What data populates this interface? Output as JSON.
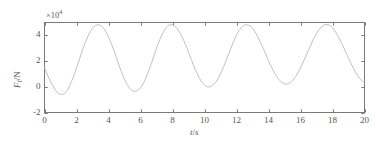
{
  "figure": {
    "exponent_label": "×10",
    "exponent_power": "4",
    "xaxis": {
      "title_var": "t",
      "title_sep": "/",
      "title_unit": "s",
      "ticks": [
        "0",
        "2",
        "4",
        "6",
        "8",
        "10",
        "12",
        "14",
        "16",
        "18",
        "20"
      ]
    },
    "yaxis": {
      "title_var": "F",
      "title_sub": "f",
      "title_sep": "/",
      "title_unit": "N",
      "ticks": [
        "-2",
        "0",
        "2",
        "4"
      ]
    },
    "line_color": "#b9b9b9",
    "axis_color": "#7a7a7a"
  },
  "chart_data": {
    "type": "line",
    "title": "",
    "xlabel": "t/s",
    "ylabel": "F_f/N",
    "xlim": [
      0,
      20
    ],
    "ylim": [
      -2,
      5
    ],
    "y_scale": 10000,
    "y_scale_label": "×10^4",
    "grid": false,
    "legend": null,
    "xticks": [
      0,
      2,
      4,
      6,
      8,
      10,
      12,
      14,
      16,
      18,
      20
    ],
    "yticks": [
      -2,
      0,
      2,
      4
    ],
    "series": [
      {
        "name": "F_f",
        "color": "#b9b9b9",
        "mean_value": 18000,
        "amplitude": 30000,
        "period": 4.0,
        "phase_peak_time": 2.9,
        "x": [
          0.0,
          0.2,
          0.4,
          0.6,
          0.8,
          1.0,
          1.2,
          1.4,
          1.6,
          1.8,
          2.0,
          2.2,
          2.4,
          2.6,
          2.8,
          3.0,
          3.2,
          3.4,
          3.6,
          3.8,
          4.0,
          4.2,
          4.4,
          4.6,
          4.8,
          5.0,
          5.2,
          5.4,
          5.6,
          5.8,
          6.0,
          6.2,
          6.4,
          6.6,
          6.8,
          7.0,
          7.2,
          7.4,
          7.6,
          7.8,
          8.0,
          8.2,
          8.4,
          8.6,
          8.8,
          9.0,
          9.2,
          9.4,
          9.6,
          9.8,
          10.0,
          10.2,
          10.4,
          10.6,
          10.8,
          11.0,
          11.2,
          11.4,
          11.6,
          11.8,
          12.0,
          12.2,
          12.4,
          12.6,
          12.8,
          13.0,
          13.2,
          13.4,
          13.6,
          13.8,
          14.0,
          14.2,
          14.4,
          14.6,
          14.8,
          15.0,
          15.2,
          15.4,
          15.6,
          15.8,
          16.0,
          16.2,
          16.4,
          16.6,
          16.8,
          17.0,
          17.2,
          17.4,
          17.6,
          17.8,
          18.0,
          18.2,
          18.4,
          18.6,
          18.8,
          19.0,
          19.2,
          19.4,
          19.6,
          19.8,
          20.0
        ],
        "y": [
          15000,
          9000,
          3500,
          -1000,
          -4500,
          -6000,
          -5500,
          -3000,
          1500,
          7500,
          14500,
          22000,
          29500,
          36000,
          41500,
          45500,
          47800,
          48200,
          46800,
          43600,
          38800,
          32800,
          26000,
          18800,
          11900,
          5800,
          1000,
          -2200,
          -3500,
          -3000,
          -700,
          3200,
          8700,
          15300,
          22500,
          29800,
          36500,
          42000,
          46000,
          48000,
          48200,
          46600,
          43400,
          38800,
          33200,
          26900,
          20400,
          14200,
          8700,
          4400,
          1400,
          0,
          200,
          2000,
          5400,
          10100,
          15800,
          22100,
          28600,
          34700,
          40200,
          44500,
          47200,
          48300,
          47700,
          45500,
          41900,
          37200,
          31800,
          26100,
          20300,
          14900,
          10200,
          6400,
          3700,
          2300,
          2200,
          3500,
          6200,
          10000,
          14700,
          20000,
          25600,
          31300,
          36700,
          41500,
          45200,
          47600,
          48500,
          47900,
          45800,
          42500,
          38100,
          33100,
          27700,
          22200,
          17000,
          12200,
          8200,
          5100,
          3100
        ]
      }
    ]
  }
}
